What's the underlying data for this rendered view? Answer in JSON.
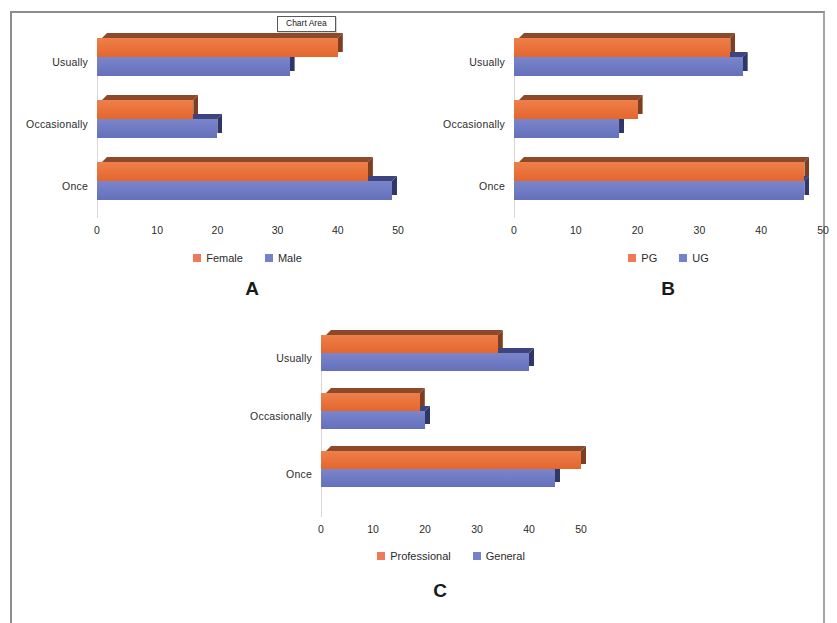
{
  "tooltip": {
    "label": "Chart Area"
  },
  "chart_data": [
    {
      "id": "A",
      "type": "bar",
      "orientation": "horizontal",
      "panel_letter": "A",
      "title": "",
      "xlabel": "",
      "ylabel": "",
      "categories": [
        "Once",
        "Occasionally",
        "Usually"
      ],
      "category_order_top_to_bottom": [
        "Usually",
        "Occasionally",
        "Once"
      ],
      "series": [
        {
          "name": "Female",
          "color": "#ef7f4b",
          "values": [
            45,
            16,
            40
          ]
        },
        {
          "name": "Male",
          "color": "#7a85cb",
          "values": [
            49,
            20,
            32
          ]
        }
      ],
      "xlim": [
        0,
        50
      ],
      "xticks": [
        0,
        10,
        20,
        30,
        40,
        50
      ],
      "xtick_labels": [
        "0",
        "10",
        "20",
        "30",
        "40",
        "50"
      ],
      "grid": false,
      "legend_position": "bottom",
      "legend": [
        "Female",
        "Male"
      ]
    },
    {
      "id": "B",
      "type": "bar",
      "orientation": "horizontal",
      "panel_letter": "B",
      "title": "",
      "xlabel": "",
      "ylabel": "",
      "categories": [
        "Once",
        "Occasionally",
        "Usually"
      ],
      "category_order_top_to_bottom": [
        "Usually",
        "Occasionally",
        "Once"
      ],
      "series": [
        {
          "name": "PG",
          "color": "#ef7f4b",
          "values": [
            47,
            20,
            35
          ]
        },
        {
          "name": "UG",
          "color": "#7a85cb",
          "values": [
            47,
            17,
            37
          ]
        }
      ],
      "xlim": [
        0,
        50
      ],
      "xticks": [
        0,
        10,
        20,
        30,
        40,
        50
      ],
      "xtick_labels": [
        "0",
        "10",
        "20",
        "30",
        "40",
        "50"
      ],
      "grid": false,
      "legend_position": "bottom",
      "legend": [
        "PG",
        "UG"
      ]
    },
    {
      "id": "C",
      "type": "bar",
      "orientation": "horizontal",
      "panel_letter": "C",
      "title": "",
      "xlabel": "",
      "ylabel": "",
      "categories": [
        "Once",
        "Occasionally",
        "Usually"
      ],
      "category_order_top_to_bottom": [
        "Usually",
        "Occasionally",
        "Once"
      ],
      "series": [
        {
          "name": "Professional",
          "color": "#ef7f4b",
          "values": [
            50,
            19,
            34
          ]
        },
        {
          "name": "General",
          "color": "#7a85cb",
          "values": [
            45,
            20,
            40
          ]
        }
      ],
      "xlim": [
        0,
        50
      ],
      "xticks": [
        0,
        10,
        20,
        30,
        40,
        50
      ],
      "xtick_labels": [
        "0",
        "10",
        "20",
        "30",
        "40",
        "50"
      ],
      "grid": false,
      "legend_position": "bottom",
      "legend": [
        "Professional",
        "General"
      ]
    }
  ]
}
